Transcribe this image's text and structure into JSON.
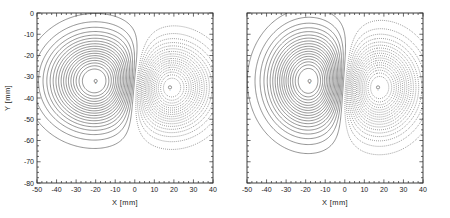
{
  "figure": {
    "title": "",
    "background_color": "#ffffff",
    "line_color": "#3a3a3a",
    "frame_color": "#2b2b2b"
  },
  "panels": [
    {
      "id": "left-panel",
      "name": "contour-panel-left",
      "xlabel": "X  [mm]",
      "ylabel": "Y  [mm]",
      "show_ylabel": true,
      "xlim": [
        -50,
        40
      ],
      "ylim": [
        -80,
        0
      ],
      "xticks": [
        -50,
        -40,
        -30,
        -20,
        -10,
        0,
        10,
        20,
        30,
        40
      ],
      "xticklabels": [
        "-50",
        "-40",
        "-30",
        "-20",
        "-10",
        "0",
        "10",
        "20",
        "30",
        "40"
      ],
      "yticks": [
        0,
        -10,
        -20,
        -30,
        -40,
        -50,
        -60,
        -70,
        -80
      ],
      "yticklabels": [
        "0",
        "-10",
        "-20",
        "-30",
        "-40",
        "-50",
        "-60",
        "-70",
        "-80"
      ],
      "xminor_step": 2.5,
      "yminor_step": 2.5,
      "extrema": [
        {
          "name": "positive-peak",
          "x": -20.0,
          "y": -32.0,
          "sign": "positive",
          "label": "+"
        },
        {
          "name": "negative-peak",
          "x": 18.0,
          "y": -35.0,
          "sign": "negative",
          "label": "-"
        }
      ]
    },
    {
      "id": "right-panel",
      "name": "contour-panel-right",
      "xlabel": "X  [mm]",
      "ylabel": "",
      "show_ylabel": false,
      "xlim": [
        -50,
        40
      ],
      "ylim": [
        -80,
        0
      ],
      "xticks": [
        -50,
        -40,
        -30,
        -20,
        -10,
        0,
        10,
        20,
        30,
        40
      ],
      "xticklabels": [
        "-50",
        "-40",
        "-30",
        "-20",
        "-10",
        "0",
        "10",
        "20",
        "30",
        "40"
      ],
      "yticks": [
        0,
        -10,
        -20,
        -30,
        -40,
        -50,
        -60,
        -70,
        -80
      ],
      "yticklabels": [
        "",
        "",
        "",
        "",
        "",
        "",
        "",
        "",
        ""
      ],
      "xminor_step": 2.5,
      "yminor_step": 2.5,
      "extrema": [
        {
          "name": "positive-peak",
          "x": -18.0,
          "y": -32.0,
          "sign": "positive",
          "label": "+"
        },
        {
          "name": "negative-peak",
          "x": 17.0,
          "y": -35.0,
          "sign": "negative",
          "label": "-"
        }
      ]
    }
  ],
  "chart_data": {
    "type": "contour",
    "title": "",
    "xlabel": "X  [mm]",
    "ylabel": "Y  [mm]",
    "xlim": [
      -50,
      40
    ],
    "ylim": [
      -80,
      0
    ],
    "grid": false,
    "legend": "none",
    "line_styles": {
      "positive": "solid",
      "negative": "dotted"
    },
    "n_levels_per_lobe": 18,
    "panels": [
      {
        "name": "left",
        "sources": [
          {
            "x": -20.0,
            "y": -32.0,
            "amplitude": 1.0,
            "sigma_x": 15.0,
            "sigma_y": 13.0,
            "style": "solid"
          },
          {
            "x": 18.0,
            "y": -35.0,
            "amplitude": -1.0,
            "sigma_x": 13.0,
            "sigma_y": 12.0,
            "style": "dotted"
          }
        ],
        "levels": [
          0.05,
          0.1,
          0.15,
          0.2,
          0.25,
          0.3,
          0.35,
          0.4,
          0.45,
          0.5,
          0.55,
          0.6,
          0.65,
          0.7,
          0.75,
          0.8,
          0.85,
          0.9
        ]
      },
      {
        "name": "right",
        "sources": [
          {
            "x": -18.0,
            "y": -32.0,
            "amplitude": 1.0,
            "sigma_x": 13.0,
            "sigma_y": 14.0,
            "style": "solid"
          },
          {
            "x": 17.0,
            "y": -35.0,
            "amplitude": -1.0,
            "sigma_x": 12.5,
            "sigma_y": 13.0,
            "style": "dotted"
          }
        ],
        "levels": [
          0.05,
          0.1,
          0.15,
          0.2,
          0.25,
          0.3,
          0.35,
          0.4,
          0.45,
          0.5,
          0.55,
          0.6,
          0.65,
          0.7,
          0.75,
          0.8,
          0.85,
          0.9
        ]
      }
    ]
  }
}
